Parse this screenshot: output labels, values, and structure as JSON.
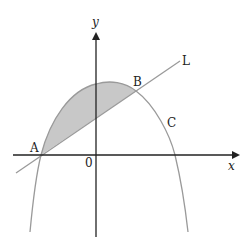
{
  "diagram": {
    "type": "coordinate-graph",
    "axes": {
      "x_label": "x",
      "y_label": "y",
      "origin_label": "0"
    },
    "curves": [
      {
        "name": "C",
        "label": "C",
        "kind": "parabola (downward opening)",
        "color": "#9a9a9a"
      },
      {
        "name": "L",
        "label": "L",
        "kind": "straight line",
        "color": "#9a9a9a"
      }
    ],
    "points": [
      {
        "name": "A",
        "label": "A"
      },
      {
        "name": "B",
        "label": "B"
      }
    ],
    "shaded_region": {
      "between": [
        "C",
        "L"
      ],
      "from": "A",
      "to": "B",
      "fill": "#c8c8c8"
    },
    "colors": {
      "axis": "#222222",
      "curve": "#9a9a9a",
      "shade": "#c8c8c8",
      "text": "#222222"
    }
  }
}
